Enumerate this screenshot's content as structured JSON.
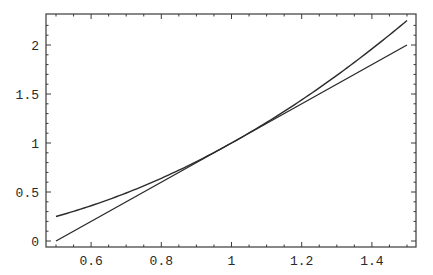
{
  "chart_data": {
    "type": "line",
    "title": "",
    "xlabel": "",
    "ylabel": "",
    "xlim": [
      0.5,
      1.5
    ],
    "ylim": [
      0,
      2.25
    ],
    "grid": false,
    "legend": null,
    "x_ticks": [
      0.6,
      0.8,
      1,
      1.2,
      1.4
    ],
    "x_tick_labels": [
      "0.6",
      "0.8",
      "1",
      "1.2",
      "1.4"
    ],
    "y_ticks": [
      0,
      0.5,
      1,
      1.5,
      2
    ],
    "y_tick_labels": [
      "0",
      "0.5",
      "1",
      "1.5",
      "2"
    ],
    "series": [
      {
        "name": "curve (x^2)",
        "x": [
          0.5,
          0.6,
          0.7,
          0.8,
          0.9,
          1.0,
          1.1,
          1.2,
          1.3,
          1.4,
          1.5
        ],
        "values": [
          0.25,
          0.36,
          0.49,
          0.64,
          0.81,
          1.0,
          1.21,
          1.44,
          1.69,
          1.96,
          2.25
        ]
      },
      {
        "name": "tangent line (2x-1)",
        "x": [
          0.5,
          1.5
        ],
        "values": [
          0,
          2
        ]
      }
    ],
    "colors": {
      "line": "#2b2b2b",
      "frame": "#3a3a3a",
      "background": "#ffffff"
    }
  }
}
